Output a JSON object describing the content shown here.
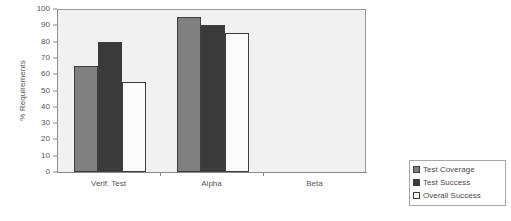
{
  "chart_data": {
    "type": "bar",
    "title": "",
    "subtitle": "",
    "xlabel": "",
    "ylabel": "% Requirements",
    "ylim": [
      0,
      100
    ],
    "ytick_step": 10,
    "yticks": [
      100,
      90,
      80,
      70,
      60,
      50,
      40,
      30,
      20,
      10,
      0
    ],
    "categories": [
      "Verif. Test",
      "Alpha",
      "Beta"
    ],
    "grid": false,
    "legend_position": "right-bottom",
    "series": [
      {
        "name": "Test Coverage",
        "color": "#808080",
        "values": [
          65,
          95,
          0
        ]
      },
      {
        "name": "Test Success",
        "color": "#3a3a3a",
        "values": [
          80,
          90,
          0
        ]
      },
      {
        "name": "Overall Success",
        "color": "#fbfbfb",
        "values": [
          55,
          85,
          0
        ]
      }
    ],
    "plot_background": "#f1f1f1",
    "axis_color": "#8a8a8a",
    "bar_border_color": "#3d3d3d"
  },
  "legend": {
    "items": [
      {
        "label": "Test Coverage"
      },
      {
        "label": "Test Success"
      },
      {
        "label": "Overall Success"
      }
    ]
  }
}
